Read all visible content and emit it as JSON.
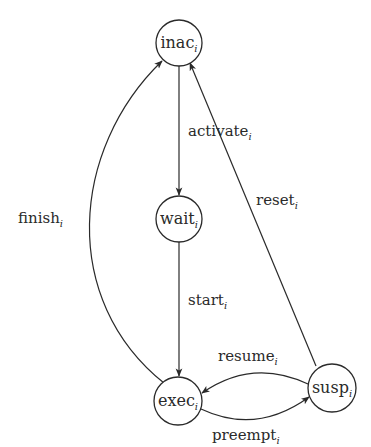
{
  "diagram": {
    "type": "state-machine",
    "colors": {
      "background": "#ffffff",
      "stroke": "#2a2a2a",
      "text": "#2a2a2a"
    },
    "nodes": [
      {
        "id": "inac",
        "base": "inac",
        "sub": "i",
        "cx": 179,
        "cy": 43,
        "r": 23
      },
      {
        "id": "wait",
        "base": "wait",
        "sub": "i",
        "cx": 179,
        "cy": 219,
        "r": 23
      },
      {
        "id": "exec",
        "base": "exec",
        "sub": "i",
        "cx": 178,
        "cy": 401,
        "r": 24
      },
      {
        "id": "susp",
        "base": "susp",
        "sub": "i",
        "cx": 332,
        "cy": 388,
        "r": 24
      }
    ],
    "edges": [
      {
        "id": "activate",
        "from": "inac",
        "to": "wait",
        "base": "activate",
        "sub": "i"
      },
      {
        "id": "start",
        "from": "wait",
        "to": "exec",
        "base": "start",
        "sub": "i"
      },
      {
        "id": "finish",
        "from": "exec",
        "to": "inac",
        "base": "finish",
        "sub": "i"
      },
      {
        "id": "reset",
        "from": "susp",
        "to": "inac",
        "base": "reset",
        "sub": "i"
      },
      {
        "id": "resume",
        "from": "susp",
        "to": "exec",
        "base": "resume",
        "sub": "i"
      },
      {
        "id": "preempt",
        "from": "exec",
        "to": "susp",
        "base": "preempt",
        "sub": "i"
      }
    ]
  }
}
